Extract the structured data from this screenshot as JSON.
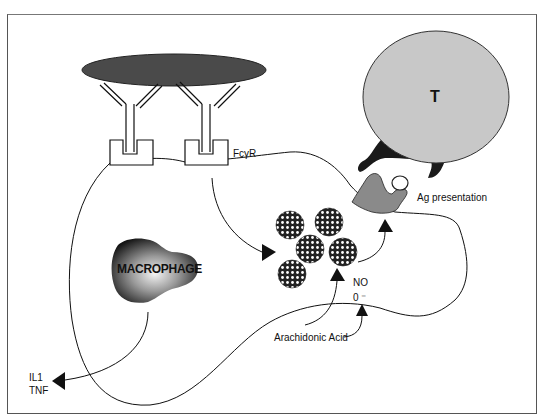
{
  "figure": {
    "cells": {
      "t_cell_label": "T",
      "macrophage_label": "MACROPHAGE"
    },
    "labels": {
      "receptor": "FcγR",
      "ag_presentation": "Ag presentation",
      "no": "NO",
      "superoxide": "0 ⁻",
      "arachidonic_acid": "Arachidonic Acid",
      "il1": "IL1",
      "tnf": "TNF"
    },
    "colors": {
      "antigen_ellipse": "#4a4a4a",
      "t_cell_fill": "#c8c8c8",
      "mhc_fill": "#1a1a1a",
      "apc_receptor_fill": "#8a8a8a",
      "line": "#111111"
    }
  }
}
